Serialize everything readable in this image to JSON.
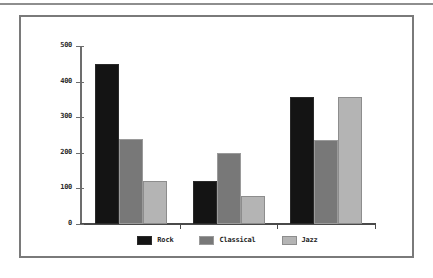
{
  "chart_data": {
    "type": "bar",
    "title": "",
    "xlabel": "",
    "ylabel": "",
    "categories": [
      "Group 1",
      "Group 2",
      "Group 3"
    ],
    "series": [
      {
        "name": "Rock",
        "color": "#141414",
        "values": [
          450,
          120,
          358
        ]
      },
      {
        "name": "Classical",
        "color": "#787878",
        "values": [
          240,
          200,
          235
        ]
      },
      {
        "name": "Jazz",
        "color": "#b4b4b4",
        "values": [
          120,
          80,
          358
        ]
      }
    ],
    "ylim": [
      0,
      500
    ],
    "yticks": [
      0,
      100,
      200,
      300,
      400,
      500
    ],
    "ytick_labels": [
      "0",
      "100",
      "200",
      "300",
      "400",
      "500"
    ],
    "xtick_labels": [
      "",
      "",
      ""
    ],
    "grid": false,
    "legend_position": "bottom"
  },
  "legend": {
    "items": [
      {
        "label": "Rock",
        "swatch": "rock-swatch"
      },
      {
        "label": "Classical",
        "swatch": "classical-swatch"
      },
      {
        "label": "Jazz",
        "swatch": "jazz-swatch"
      }
    ]
  }
}
